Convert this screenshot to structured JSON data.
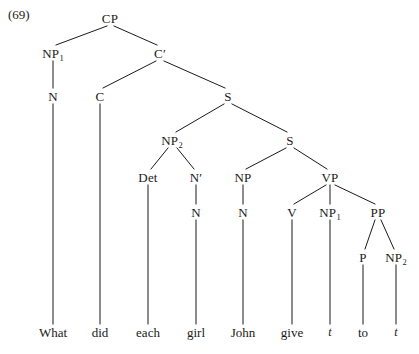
{
  "figure": {
    "example_number": "(69)",
    "sentence": "What did each girl John give t to t",
    "line_color": "#1a1a1a",
    "text_color": "#1a1a1a",
    "background_color": "#ffffff"
  },
  "nodes": [
    {
      "id": "CP",
      "label": "CP",
      "sub": "",
      "x": 110,
      "y": 18
    },
    {
      "id": "NP1",
      "label": "NP",
      "sub": "1",
      "x": 53,
      "y": 53
    },
    {
      "id": "Cbar",
      "label": "C",
      "sub": "",
      "x": 160,
      "y": 53,
      "prime": true
    },
    {
      "id": "N_a",
      "label": "N",
      "sub": "",
      "x": 53,
      "y": 96
    },
    {
      "id": "C",
      "label": "C",
      "sub": "",
      "x": 100,
      "y": 96
    },
    {
      "id": "S1",
      "label": "S",
      "sub": "",
      "x": 228,
      "y": 96
    },
    {
      "id": "NP2",
      "label": "NP",
      "sub": "2",
      "x": 172,
      "y": 140
    },
    {
      "id": "S2",
      "label": "S",
      "sub": "",
      "x": 290,
      "y": 140
    },
    {
      "id": "Det",
      "label": "Det",
      "sub": "",
      "x": 148,
      "y": 177
    },
    {
      "id": "Nbar",
      "label": "N",
      "sub": "",
      "x": 196,
      "y": 177,
      "prime": true
    },
    {
      "id": "NP_b",
      "label": "NP",
      "sub": "",
      "x": 243,
      "y": 177
    },
    {
      "id": "VP",
      "label": "VP",
      "sub": "",
      "x": 330,
      "y": 177
    },
    {
      "id": "N_b",
      "label": "N",
      "sub": "",
      "x": 196,
      "y": 212
    },
    {
      "id": "N_c",
      "label": "N",
      "sub": "",
      "x": 243,
      "y": 212
    },
    {
      "id": "V",
      "label": "V",
      "sub": "",
      "x": 292,
      "y": 212
    },
    {
      "id": "NP1b",
      "label": "NP",
      "sub": "1",
      "x": 330,
      "y": 212
    },
    {
      "id": "PP",
      "label": "PP",
      "sub": "",
      "x": 378,
      "y": 212
    },
    {
      "id": "P",
      "label": "P",
      "sub": "",
      "x": 363,
      "y": 257
    },
    {
      "id": "NP2b",
      "label": "NP",
      "sub": "2",
      "x": 396,
      "y": 257
    }
  ],
  "terminals": [
    {
      "id": "t-what",
      "text": "What",
      "x": 53,
      "y": 332,
      "trace": false
    },
    {
      "id": "t-did",
      "text": "did",
      "x": 100,
      "y": 332,
      "trace": false
    },
    {
      "id": "t-each",
      "text": "each",
      "x": 148,
      "y": 332,
      "trace": false
    },
    {
      "id": "t-girl",
      "text": "girl",
      "x": 196,
      "y": 332,
      "trace": false
    },
    {
      "id": "t-john",
      "text": "John",
      "x": 243,
      "y": 332,
      "trace": false
    },
    {
      "id": "t-give",
      "text": "give",
      "x": 292,
      "y": 332,
      "trace": false
    },
    {
      "id": "t-tr1",
      "text": "t",
      "x": 330,
      "y": 332,
      "trace": true
    },
    {
      "id": "t-to",
      "text": "to",
      "x": 363,
      "y": 332,
      "trace": false
    },
    {
      "id": "t-tr2",
      "text": "t",
      "x": 396,
      "y": 332,
      "trace": true
    }
  ],
  "branches": [
    {
      "from": "CP",
      "to": "NP1",
      "x1": 107,
      "y1": 26,
      "x2": 56,
      "y2": 45
    },
    {
      "from": "CP",
      "to": "Cbar",
      "x1": 114,
      "y1": 26,
      "x2": 157,
      "y2": 45
    },
    {
      "from": "NP1",
      "to": "N_a",
      "x1": 53,
      "y1": 61,
      "x2": 53,
      "y2": 88
    },
    {
      "from": "Cbar",
      "to": "C",
      "x1": 156,
      "y1": 61,
      "x2": 103,
      "y2": 88
    },
    {
      "from": "Cbar",
      "to": "S1",
      "x1": 164,
      "y1": 61,
      "x2": 225,
      "y2": 88
    },
    {
      "from": "C",
      "to": "did",
      "x1": 100,
      "y1": 104,
      "x2": 100,
      "y2": 324
    },
    {
      "from": "N_a",
      "to": "What",
      "x1": 53,
      "y1": 104,
      "x2": 53,
      "y2": 324
    },
    {
      "from": "S1",
      "to": "NP2",
      "x1": 224,
      "y1": 104,
      "x2": 176,
      "y2": 132
    },
    {
      "from": "S1",
      "to": "S2",
      "x1": 232,
      "y1": 104,
      "x2": 287,
      "y2": 132
    },
    {
      "from": "NP2",
      "to": "Det",
      "x1": 168,
      "y1": 148,
      "x2": 151,
      "y2": 169
    },
    {
      "from": "NP2",
      "to": "Nbar",
      "x1": 177,
      "y1": 148,
      "x2": 194,
      "y2": 169
    },
    {
      "from": "S2",
      "to": "NP_b",
      "x1": 286,
      "y1": 148,
      "x2": 246,
      "y2": 169
    },
    {
      "from": "S2",
      "to": "VP",
      "x1": 294,
      "y1": 148,
      "x2": 327,
      "y2": 169
    },
    {
      "from": "Det",
      "to": "each",
      "x1": 148,
      "y1": 185,
      "x2": 148,
      "y2": 324
    },
    {
      "from": "Nbar",
      "to": "N_b",
      "x1": 196,
      "y1": 185,
      "x2": 196,
      "y2": 204
    },
    {
      "from": "NP_b",
      "to": "N_c",
      "x1": 243,
      "y1": 185,
      "x2": 243,
      "y2": 204
    },
    {
      "from": "N_b",
      "to": "girl",
      "x1": 196,
      "y1": 220,
      "x2": 196,
      "y2": 324
    },
    {
      "from": "N_c",
      "to": "John",
      "x1": 243,
      "y1": 220,
      "x2": 243,
      "y2": 324
    },
    {
      "from": "VP",
      "to": "V",
      "x1": 326,
      "y1": 185,
      "x2": 294,
      "y2": 204
    },
    {
      "from": "VP",
      "to": "NP1b",
      "x1": 330,
      "y1": 185,
      "x2": 330,
      "y2": 204
    },
    {
      "from": "VP",
      "to": "PP",
      "x1": 335,
      "y1": 185,
      "x2": 375,
      "y2": 204
    },
    {
      "from": "V",
      "to": "give",
      "x1": 292,
      "y1": 220,
      "x2": 292,
      "y2": 324
    },
    {
      "from": "NP1b",
      "to": "tr1",
      "x1": 330,
      "y1": 220,
      "x2": 330,
      "y2": 324
    },
    {
      "from": "PP",
      "to": "P",
      "x1": 375,
      "y1": 220,
      "x2": 365,
      "y2": 249
    },
    {
      "from": "PP",
      "to": "NP2b",
      "x1": 381,
      "y1": 220,
      "x2": 394,
      "y2": 249
    },
    {
      "from": "P",
      "to": "to",
      "x1": 363,
      "y1": 265,
      "x2": 363,
      "y2": 324
    },
    {
      "from": "NP2b",
      "to": "tr2",
      "x1": 396,
      "y1": 265,
      "x2": 396,
      "y2": 324
    }
  ]
}
